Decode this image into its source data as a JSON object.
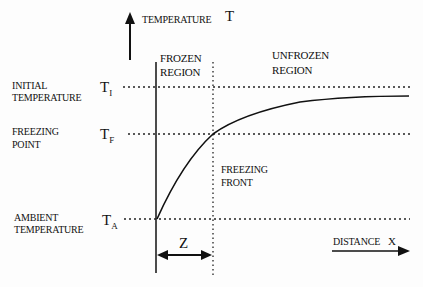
{
  "diagram": {
    "y_axis": {
      "label": "TEMPERATURE",
      "symbol": "T"
    },
    "x_axis": {
      "label": "DISTANCE",
      "symbol": "X"
    },
    "regions": {
      "frozen": [
        "FROZEN",
        "REGION"
      ],
      "unfrozen": [
        "UNFROZEN",
        "REGION"
      ]
    },
    "levels": [
      {
        "name": "initial",
        "label": [
          "INITIAL",
          "TEMPERATURE"
        ],
        "symbol": "T",
        "subscript": "I"
      },
      {
        "name": "freezing",
        "label": [
          "FREEZING",
          "POINT"
        ],
        "symbol": "T",
        "subscript": "F"
      },
      {
        "name": "ambient",
        "label": [
          "AMBIENT",
          "TEMPERATURE"
        ],
        "symbol": "T",
        "subscript": "A"
      }
    ],
    "front": {
      "label": [
        "FREEZING",
        "FRONT"
      ]
    },
    "depth": {
      "symbol": "Z"
    }
  }
}
